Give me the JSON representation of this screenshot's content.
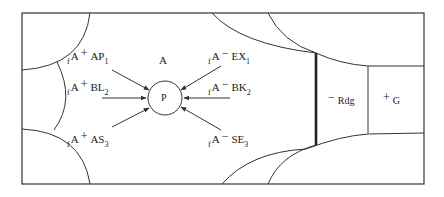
{
  "diagram": {
    "type": "force-field / competitive positioning diagram",
    "region_label": "A",
    "center_node": "P",
    "inputs_left": [
      {
        "prefix": "f",
        "base": "A",
        "sign": "+",
        "code": "AP",
        "index": "1"
      },
      {
        "prefix": "f",
        "base": "A",
        "sign": "+",
        "code": "BL",
        "index": "2"
      },
      {
        "prefix": "f",
        "base": "A",
        "sign": "+",
        "code": "AS",
        "index": "3"
      }
    ],
    "inputs_right": [
      {
        "prefix": "f",
        "base": "A",
        "sign": "−",
        "code": "EX",
        "index": "1"
      },
      {
        "prefix": "f",
        "base": "A",
        "sign": "−",
        "code": "BK",
        "index": "2"
      },
      {
        "prefix": "f",
        "base": "A",
        "sign": "−",
        "code": "SE",
        "index": "3"
      }
    ],
    "right_zones": [
      {
        "sign": "−",
        "label": "Rdg"
      },
      {
        "sign": "+",
        "label": "G"
      }
    ],
    "colors": {
      "stroke": "#333333",
      "background": "#ffffff"
    }
  }
}
